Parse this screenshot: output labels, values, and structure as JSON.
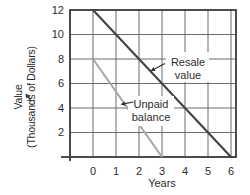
{
  "chart_data": {
    "type": "line",
    "title": "",
    "xlabel": "Years",
    "ylabel": "Value (Thousands of Dollars)",
    "ylabel_lines": [
      "Value",
      "(Thousands of Dollars)"
    ],
    "x_ticks": [
      "0",
      "1",
      "2",
      "3",
      "4",
      "5",
      "6"
    ],
    "y_ticks": [
      "2",
      "4",
      "6",
      "8",
      "10",
      "12"
    ],
    "xlim": [
      0,
      6
    ],
    "ylim": [
      0,
      12
    ],
    "grid": true,
    "legend_position": "inline-annotations",
    "series": [
      {
        "name": "Resale value",
        "label_lines": [
          "Resale",
          "value"
        ],
        "color": "#414141",
        "points": [
          [
            0,
            12
          ],
          [
            6,
            0
          ]
        ]
      },
      {
        "name": "Unpaid balance",
        "label_lines": [
          "Unpaid",
          "balance"
        ],
        "color": "#a8a8a8",
        "points": [
          [
            0,
            8
          ],
          [
            3,
            0
          ]
        ]
      }
    ],
    "colors": {
      "background": "#ffffff",
      "grid": "#5c5c5c",
      "frame": "#3a3a3a",
      "text": "#2d2d2d",
      "arrow": "#2d2d2d"
    }
  }
}
